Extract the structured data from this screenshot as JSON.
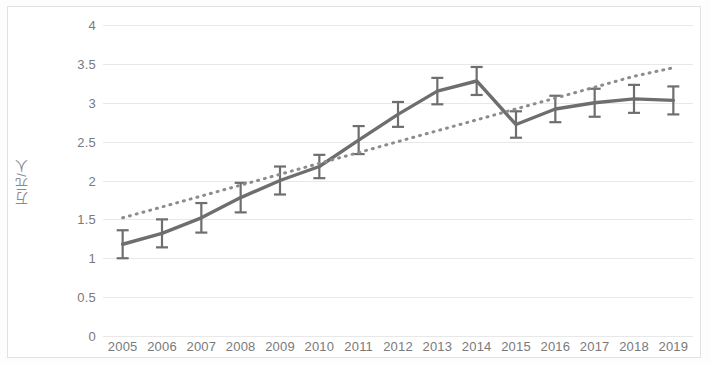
{
  "chart_data": {
    "type": "line",
    "title": "",
    "subtitle": "",
    "xlabel": "",
    "ylabel": "万元/人",
    "categories": [
      "2005",
      "2006",
      "2007",
      "2008",
      "2009",
      "2010",
      "2011",
      "2012",
      "2013",
      "2014",
      "2015",
      "2016",
      "2017",
      "2018",
      "2019"
    ],
    "ylim": [
      0,
      4
    ],
    "ytick_values": [
      0,
      0.5,
      1,
      1.5,
      2,
      2.5,
      3,
      3.5,
      4
    ],
    "ytick_labels": [
      "0",
      "0.5",
      "1",
      "1.5",
      "2",
      "2.5",
      "3",
      "3.5",
      "4"
    ],
    "grid": true,
    "grid_axis": "y",
    "legend": false,
    "legend_position": "none",
    "series": [
      {
        "name": "万元/人",
        "type": "line",
        "style": "solid",
        "color": "#6e6e6e",
        "values": [
          1.18,
          1.32,
          1.52,
          1.78,
          2.0,
          2.18,
          2.52,
          2.85,
          3.15,
          3.28,
          2.72,
          2.92,
          3.0,
          3.05,
          3.03
        ],
        "error_bars": [
          0.18,
          0.18,
          0.19,
          0.19,
          0.18,
          0.15,
          0.18,
          0.16,
          0.17,
          0.18,
          0.17,
          0.17,
          0.18,
          0.18,
          0.18
        ]
      },
      {
        "name": "趋势线",
        "type": "trendline",
        "style": "dotted",
        "color": "#8c8c8c",
        "values": [
          1.52,
          1.66,
          1.8,
          1.94,
          2.08,
          2.22,
          2.36,
          2.5,
          2.64,
          2.78,
          2.92,
          3.06,
          3.2,
          3.34,
          3.45
        ]
      }
    ],
    "annotations": []
  },
  "colors": {
    "series_line": "#6e6e6e",
    "trendline": "#8c8c8c",
    "gridline": "#e8e8e8",
    "tick_text": "#7a7a7a",
    "axis_title": "#8a8a8a",
    "frame": "#e2e2e2",
    "background": "#ffffff"
  }
}
